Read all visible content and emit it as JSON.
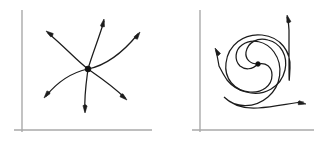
{
  "figure": {
    "background_color": "#ffffff",
    "width": 316,
    "height": 145,
    "axis_color": "#a9a9a9",
    "curve_color": "#1c1c1c",
    "fixed_point_color": "#111111"
  },
  "panels": [
    {
      "id": "left-panel",
      "name": "unstable-node",
      "label": "",
      "axes": {
        "vertical": {
          "x": 22,
          "y_top": 10,
          "y_bottom": 132
        },
        "horizontal": {
          "y": 130,
          "x_left": 14,
          "x_right": 152
        }
      },
      "fixed_point": {
        "x": 88,
        "y": 69,
        "radius": 2.9,
        "type": "unstable node",
        "stability": "unstable"
      },
      "trajectory_count": 6,
      "flow_direction": "outward",
      "rotation_sense": "counterclockwise",
      "trajectories": [
        {
          "name": "traj-upper-left",
          "path": "M 88 69 C 76 60 66 48 48 33",
          "arrow": {
            "x": 46,
            "y": 31,
            "angle": -140
          }
        },
        {
          "name": "traj-up",
          "path": "M 88 69 C 92 55 99 38 104 21",
          "arrow": {
            "x": 104,
            "y": 19,
            "angle": -73
          }
        },
        {
          "name": "traj-upper-right",
          "path": "M 88 69 C 103 66 120 56 138 34",
          "arrow": {
            "x": 140,
            "y": 32,
            "angle": -50
          }
        },
        {
          "name": "traj-lower-right",
          "path": "M 88 69 C 101 78 113 86 125 98",
          "arrow": {
            "x": 127,
            "y": 100,
            "angle": 45
          }
        },
        {
          "name": "traj-down",
          "path": "M 88 69 C 86 84 84 97 85 111",
          "arrow": {
            "x": 85,
            "y": 113,
            "angle": 95
          }
        },
        {
          "name": "traj-lower-left",
          "path": "M 88 69 C 74 72 59 80 46 96",
          "arrow": {
            "x": 44,
            "y": 98,
            "angle": 133
          }
        }
      ]
    },
    {
      "id": "right-panel",
      "name": "unstable-spiral",
      "label": "",
      "axes": {
        "vertical": {
          "x": 200,
          "y_top": 10,
          "y_bottom": 132
        },
        "horizontal": {
          "y": 130,
          "x_left": 192,
          "x_right": 314
        }
      },
      "fixed_point": {
        "x": 258,
        "y": 64,
        "radius": 2.3,
        "type": "unstable spiral (focus)",
        "stability": "unstable"
      },
      "trajectory_count": 3,
      "flow_direction": "outward",
      "rotation_sense": "counterclockwise",
      "spiral_arms": [
        {
          "name": "spiral-arm-upper-right",
          "path": "M 258 64 C 266 62 272 67 272 75 C 272 86 262 93 250 92 C 234 91 224 78 226 63 C 228 45 244 33 262 35 C 281 37 291 52 290 68 C 289 84 289 95 289 30 C 289 25 288 20 287 17",
          "arrow": {
            "x": 287,
            "y": 15,
            "angle": -100
          }
        },
        {
          "name": "spiral-arm-left",
          "path": "M 258 64 C 250 64 245 59 246 52 C 248 42 258 37 268 40 C 281 43 288 56 285 70 C 281 87 264 97 246 92 C 238 90 232 86 227 80 C 225 77 222 72 219 66 C 218 60 217 55 216 50",
          "arrow": {
            "x": 215,
            "y": 48,
            "angle": -115
          }
        },
        {
          "name": "spiral-arm-lower-right",
          "path": "M 258 64 C 252 70 245 70 240 66 C 234 60 235 50 242 45 C 252 38 266 41 274 52 C 284 66 281 86 268 97 C 254 109 235 108 224 97 C 231 104 243 109 258 108 C 275 107 291 103 303 102",
          "arrow": {
            "x": 306,
            "y": 104,
            "angle": 15
          }
        }
      ]
    }
  ]
}
